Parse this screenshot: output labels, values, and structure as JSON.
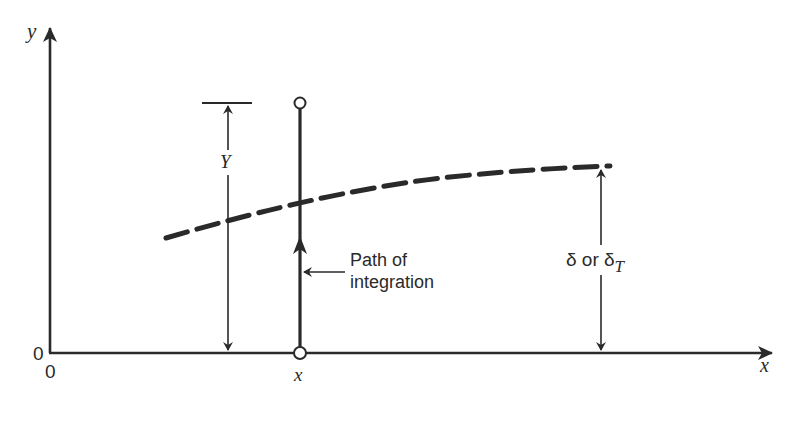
{
  "diagram": {
    "axes": {
      "y_label": "y",
      "x_label": "x",
      "origin_y_label": "0",
      "origin_x_label": "0",
      "x_position_label": "x"
    },
    "labels": {
      "Y_dimension": "Y",
      "path_line1": "Path of",
      "path_line2": "integration",
      "delta_prefix": "δ or δ",
      "delta_subscript": "T"
    },
    "elements": [
      "y-axis with arrow",
      "x-axis with arrow",
      "dashed boundary-layer curve (δ or δT)",
      "vertical path of integration at x with open circles at ends",
      "Y dimension arrow from x-axis to top of path",
      "δ dimension arrow from x-axis to curve"
    ],
    "colors": {
      "ink": "#2a2a2a",
      "background": "#ffffff"
    }
  }
}
